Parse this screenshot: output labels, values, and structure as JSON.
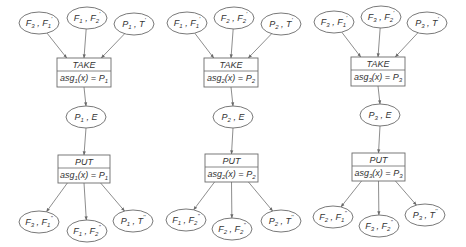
{
  "diagram": {
    "colors": {
      "stroke": "#6a6a6a",
      "text": "#333333",
      "background": "#ffffff"
    },
    "columns": [
      {
        "id": 1,
        "inputs": [
          {
            "cx": 39,
            "cy": 23,
            "a": "F",
            "as": "3",
            "b": "F",
            "bs": "1",
            "bp": "'"
          },
          {
            "cx": 87,
            "cy": 18,
            "a": "F",
            "as": "1",
            "b": "F",
            "bs": "2",
            "bp": "'"
          },
          {
            "cx": 134,
            "cy": 24,
            "a": "P",
            "as": "1",
            "b": "T",
            "bs": "",
            "bp": "'"
          }
        ],
        "take": {
          "x": 57,
          "y": 58,
          "w": 54,
          "h": 29,
          "title": "TAKE",
          "expr_fn": "asg",
          "expr_sub": "1",
          "expr_arg": "(x) = ",
          "expr_val": "P",
          "expr_val_sub": "1"
        },
        "state": {
          "cx": 86,
          "cy": 117,
          "a": "P",
          "as": "1",
          "b": "E",
          "bs": "",
          "bp": ""
        },
        "put": {
          "x": 58,
          "y": 155,
          "w": 52,
          "h": 28,
          "title": "PUT",
          "expr_fn": "asg",
          "expr_sub": "1",
          "expr_arg": "(x) = ",
          "expr_val": "P",
          "expr_val_sub": "1"
        },
        "outputs": [
          {
            "cx": 39,
            "cy": 222,
            "a": "F",
            "as": "3",
            "b": "F",
            "bs": "1",
            "bp": "''"
          },
          {
            "cx": 87,
            "cy": 231,
            "a": "F",
            "as": "1",
            "b": "F",
            "bs": "2",
            "bp": "''"
          },
          {
            "cx": 133,
            "cy": 221,
            "a": "P",
            "as": "1",
            "b": "T",
            "bs": "",
            "bp": "''"
          }
        ]
      },
      {
        "id": 2,
        "inputs": [
          {
            "cx": 187,
            "cy": 23,
            "a": "F",
            "as": "1",
            "b": "F",
            "bs": "1",
            "bp": "'"
          },
          {
            "cx": 234,
            "cy": 18,
            "a": "F",
            "as": "2",
            "b": "F",
            "bs": "2",
            "bp": "'"
          },
          {
            "cx": 281,
            "cy": 24,
            "a": "P",
            "as": "2",
            "b": "T",
            "bs": "",
            "bp": "'"
          }
        ],
        "take": {
          "x": 204,
          "y": 58,
          "w": 54,
          "h": 29,
          "title": "TAKE",
          "expr_fn": "asg",
          "expr_sub": "2",
          "expr_arg": "(x) = ",
          "expr_val": "P",
          "expr_val_sub": "2"
        },
        "state": {
          "cx": 233,
          "cy": 117,
          "a": "P",
          "as": "2",
          "b": "E",
          "bs": "",
          "bp": ""
        },
        "put": {
          "x": 205,
          "y": 154,
          "w": 53,
          "h": 28,
          "title": "PUT",
          "expr_fn": "asg",
          "expr_sub": "2",
          "expr_arg": "(x) = ",
          "expr_val": "P",
          "expr_val_sub": "2"
        },
        "outputs": [
          {
            "cx": 186,
            "cy": 220,
            "a": "F",
            "as": "1",
            "b": "F",
            "bs": "2",
            "bp": "''"
          },
          {
            "cx": 232,
            "cy": 229,
            "a": "F",
            "as": "2",
            "b": "F",
            "bs": "2",
            "bp": "''"
          },
          {
            "cx": 281,
            "cy": 221,
            "a": "P",
            "as": "2",
            "b": "T",
            "bs": "",
            "bp": "''"
          }
        ]
      },
      {
        "id": 3,
        "inputs": [
          {
            "cx": 334,
            "cy": 22,
            "a": "F",
            "as": "3",
            "b": "F",
            "bs": "1",
            "bp": "'"
          },
          {
            "cx": 381,
            "cy": 17,
            "a": "F",
            "as": "3",
            "b": "F",
            "bs": "2",
            "bp": "'"
          },
          {
            "cx": 427,
            "cy": 23,
            "a": "P",
            "as": "3",
            "b": "T",
            "bs": "",
            "bp": "'"
          }
        ],
        "take": {
          "x": 351,
          "y": 57,
          "w": 54,
          "h": 29,
          "title": "TAKE",
          "expr_fn": "asg",
          "expr_sub": "3",
          "expr_arg": "(x) = ",
          "expr_val": "P",
          "expr_val_sub": "3"
        },
        "state": {
          "cx": 380,
          "cy": 115,
          "a": "P",
          "as": "3",
          "b": "E",
          "bs": "",
          "bp": ""
        },
        "put": {
          "x": 352,
          "y": 153,
          "w": 53,
          "h": 28,
          "title": "PUT",
          "expr_fn": "asg",
          "expr_sub": "3",
          "expr_arg": "(x) = ",
          "expr_val": "P",
          "expr_val_sub": "3"
        },
        "outputs": [
          {
            "cx": 333,
            "cy": 217,
            "a": "F",
            "as": "2",
            "b": "F",
            "bs": "1",
            "bp": "''"
          },
          {
            "cx": 379,
            "cy": 226,
            "a": "F",
            "as": "3",
            "b": "F",
            "bs": "2",
            "bp": "''"
          },
          {
            "cx": 425,
            "cy": 215,
            "a": "P",
            "as": "3",
            "b": "T",
            "bs": "",
            "bp": "''"
          }
        ]
      }
    ],
    "ellipse_rx": 20,
    "ellipse_ry": 11
  }
}
